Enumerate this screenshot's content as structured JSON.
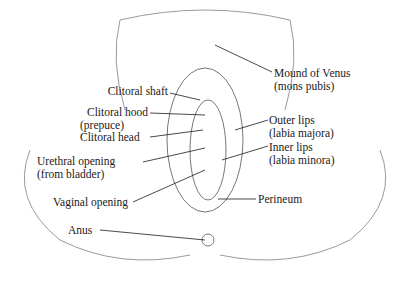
{
  "diagram": {
    "type": "anatomical-illustration",
    "colors": {
      "ink": "#1a1a1a",
      "shading": "#9a9a9a",
      "background": "#ffffff"
    },
    "labels": [
      {
        "id": "clitoral_shaft",
        "line1": "Clitoral shaft",
        "line2": ""
      },
      {
        "id": "clitoral_hood",
        "line1": "Clitoral hood",
        "line2": "(prepuce)"
      },
      {
        "id": "clitoral_head",
        "line1": "Clitoral head",
        "line2": ""
      },
      {
        "id": "urethral_opening",
        "line1": "Urethral opening",
        "line2": "(from bladder)"
      },
      {
        "id": "vaginal_opening",
        "line1": "Vaginal opening",
        "line2": ""
      },
      {
        "id": "anus",
        "line1": "Anus",
        "line2": ""
      },
      {
        "id": "mons_pubis",
        "line1": "Mound of Venus",
        "line2": "(mons pubis)"
      },
      {
        "id": "labia_majora",
        "line1": "Outer lips",
        "line2": "(labia majora)"
      },
      {
        "id": "labia_minora",
        "line1": "Inner lips",
        "line2": "(labia minora)"
      },
      {
        "id": "perineum",
        "line1": "Perineum",
        "line2": ""
      }
    ]
  }
}
